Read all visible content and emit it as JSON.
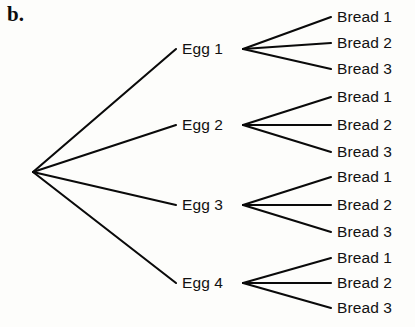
{
  "figure": {
    "panel_letter": "b.",
    "type": "probability-tree-diagram",
    "line_color": "#0a0a0a",
    "background_color": "#fdfdfb",
    "text_color": "#111111"
  },
  "root": {
    "label": "",
    "x": 33,
    "y": 172
  },
  "branches": [
    {
      "label": "Egg 1",
      "label_x": 182,
      "label_y": 49,
      "node_x": 243,
      "node_y": 49,
      "leaves": [
        {
          "label": "Bread 1",
          "x": 337,
          "y": 17
        },
        {
          "label": "Bread 2",
          "x": 337,
          "y": 43
        },
        {
          "label": "Bread 3",
          "x": 337,
          "y": 69
        }
      ]
    },
    {
      "label": "Egg 2",
      "label_x": 182,
      "label_y": 125,
      "node_x": 243,
      "node_y": 125,
      "leaves": [
        {
          "label": "Bread 1",
          "x": 337,
          "y": 97
        },
        {
          "label": "Bread 2",
          "x": 337,
          "y": 125
        },
        {
          "label": "Bread 3",
          "x": 337,
          "y": 152
        }
      ]
    },
    {
      "label": "Egg 3",
      "label_x": 182,
      "label_y": 205,
      "node_x": 243,
      "node_y": 205,
      "leaves": [
        {
          "label": "Bread 1",
          "x": 337,
          "y": 177
        },
        {
          "label": "Bread 2",
          "x": 337,
          "y": 205
        },
        {
          "label": "Bread 3",
          "x": 337,
          "y": 232
        }
      ]
    },
    {
      "label": "Egg 4",
      "label_x": 182,
      "label_y": 283,
      "node_x": 243,
      "node_y": 283,
      "leaves": [
        {
          "label": "Bread 1",
          "x": 337,
          "y": 258
        },
        {
          "label": "Bread 2",
          "x": 337,
          "y": 283
        },
        {
          "label": "Bread 3",
          "x": 337,
          "y": 308
        }
      ]
    }
  ]
}
